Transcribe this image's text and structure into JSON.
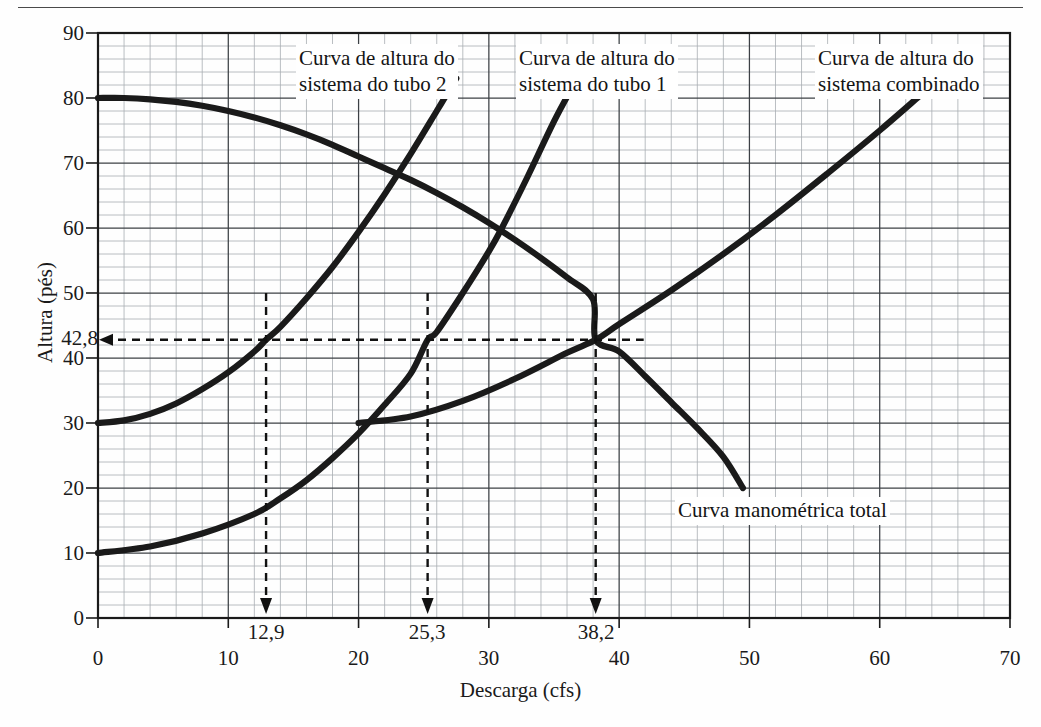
{
  "figure": {
    "x_axis_label": "Descarga (cfs)",
    "y_axis_label": "Altura (pés)"
  },
  "annotations": {
    "tube2": "Curva de altura do\nsistema do tubo 2",
    "tube2_line1": "Curva de altura do",
    "tube2_line2": "sistema do tubo 2",
    "tube1_line1": "Curva de altura do",
    "tube1_line2": "sistema do tubo 1",
    "combined_line1": "Curva de altura do",
    "combined_line2": "sistema combinado",
    "manometric": "Curva manométrica total"
  },
  "markers": {
    "head_value": "42,8",
    "q1": "12,9",
    "q2": "25,3",
    "q3": "38,2"
  },
  "chart_data": {
    "type": "line",
    "title": "",
    "xlabel": "Descarga (cfs)",
    "ylabel": "Altura (pés)",
    "xlim": [
      0,
      70
    ],
    "ylim": [
      0,
      90
    ],
    "xticks": [
      0,
      10,
      20,
      30,
      40,
      50,
      60,
      70
    ],
    "yticks": [
      0,
      10,
      20,
      30,
      40,
      50,
      60,
      70,
      80,
      90
    ],
    "xtick_labels": [
      "0",
      "10",
      "20",
      "30",
      "40",
      "50",
      "60",
      "70"
    ],
    "ytick_labels": [
      "0",
      "10",
      "20",
      "30",
      "40",
      "50",
      "60",
      "70",
      "80",
      "90"
    ],
    "extra_ytick": {
      "value": 42.8,
      "label": "42,8"
    },
    "grid": true,
    "grid_minor_x_per_major": 5,
    "grid_minor_y_per_major": 5,
    "legend": "inline-annotations",
    "line_color": "#1a1a1a",
    "grid_color": "#9aa0a6",
    "series": [
      {
        "name": "Curva manométrica total",
        "label_x": 38.5,
        "label_y": 22.5,
        "points": [
          [
            0,
            80.0
          ],
          [
            2,
            80.0
          ],
          [
            4,
            79.8
          ],
          [
            6,
            79.4
          ],
          [
            8,
            78.8
          ],
          [
            10,
            78.0
          ],
          [
            12,
            77.0
          ],
          [
            14,
            75.8
          ],
          [
            16,
            74.4
          ],
          [
            18,
            72.8
          ],
          [
            20,
            71.0
          ],
          [
            22,
            69.2
          ],
          [
            24,
            67.4
          ],
          [
            26,
            65.4
          ],
          [
            28,
            63.2
          ],
          [
            30,
            60.8
          ],
          [
            32,
            58.2
          ],
          [
            34,
            55.4
          ],
          [
            36,
            52.4
          ],
          [
            38,
            49.0
          ],
          [
            38.2,
            42.8
          ],
          [
            40,
            41.0
          ],
          [
            42,
            37.2
          ],
          [
            44,
            33.2
          ],
          [
            46,
            29.2
          ],
          [
            48,
            24.8
          ],
          [
            49.5,
            20.0
          ]
        ]
      },
      {
        "name": "Curva de altura do sistema do tubo 1",
        "label_x": 25.5,
        "label_y": 86.0,
        "points": [
          [
            0,
            10.0
          ],
          [
            4,
            11.0
          ],
          [
            8,
            13.0
          ],
          [
            12,
            16.0
          ],
          [
            14,
            18.4
          ],
          [
            16,
            21.2
          ],
          [
            18,
            24.6
          ],
          [
            20,
            28.4
          ],
          [
            22,
            32.8
          ],
          [
            24,
            37.6
          ],
          [
            25.3,
            42.8
          ],
          [
            26,
            44.0
          ],
          [
            28,
            50.0
          ],
          [
            30,
            56.4
          ],
          [
            31,
            60.0
          ],
          [
            33,
            68.0
          ],
          [
            35,
            76.4
          ],
          [
            36.5,
            82.0
          ]
        ]
      },
      {
        "name": "Curva de altura do sistema do tubo 2",
        "label_x": 13.0,
        "label_y": 86.0,
        "points": [
          [
            0,
            30.0
          ],
          [
            2,
            30.4
          ],
          [
            4,
            31.4
          ],
          [
            6,
            33.0
          ],
          [
            8,
            35.2
          ],
          [
            10,
            37.8
          ],
          [
            12,
            41.0
          ],
          [
            12.9,
            42.8
          ],
          [
            14,
            44.8
          ],
          [
            16,
            49.2
          ],
          [
            18,
            54.0
          ],
          [
            20,
            59.4
          ],
          [
            22,
            65.2
          ],
          [
            24,
            71.4
          ],
          [
            26,
            78.0
          ],
          [
            27.5,
            83.0
          ]
        ]
      },
      {
        "name": "Curva de altura do sistema combinado",
        "label_x": 52.0,
        "label_y": 86.0,
        "points": [
          [
            20,
            30.0
          ],
          [
            24,
            31.0
          ],
          [
            28,
            33.4
          ],
          [
            32,
            36.8
          ],
          [
            36,
            40.8
          ],
          [
            38.2,
            42.8
          ],
          [
            40,
            45.2
          ],
          [
            44,
            50.4
          ],
          [
            48,
            56.0
          ],
          [
            52,
            62.0
          ],
          [
            56,
            68.4
          ],
          [
            60,
            75.0
          ],
          [
            63,
            80.2
          ]
        ]
      }
    ],
    "intersections": [
      {
        "q": 12.9,
        "h": 42.8,
        "with": "Curva de altura do sistema do tubo 2"
      },
      {
        "q": 25.3,
        "h": 42.8,
        "with": "Curva de altura do sistema do tubo 1"
      },
      {
        "q": 38.2,
        "h": 42.8,
        "with": "Curva de altura do sistema combinado"
      }
    ]
  }
}
